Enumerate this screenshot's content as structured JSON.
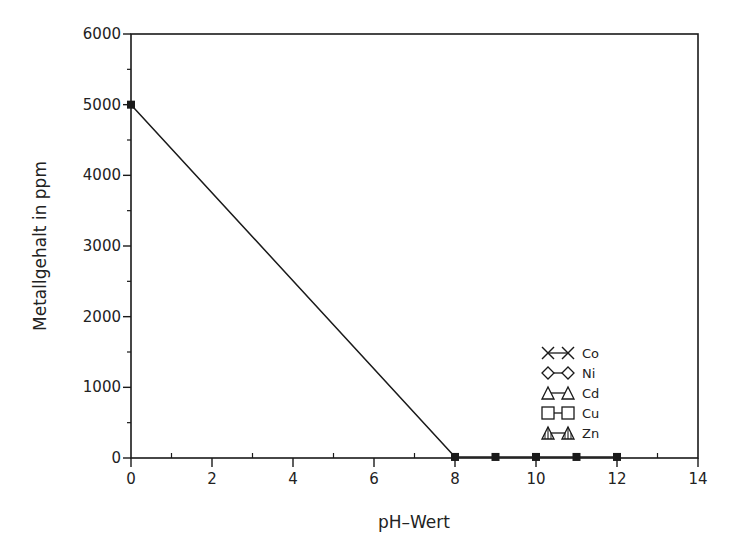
{
  "chart_data": {
    "type": "line",
    "title": "",
    "xlabel": "pH–Wert",
    "ylabel": "Metallgehalt in ppm",
    "xlim": [
      0,
      14
    ],
    "ylim": [
      0,
      6000
    ],
    "x_ticks": [
      0,
      2,
      4,
      6,
      8,
      10,
      12,
      14
    ],
    "x_tick_labels": [
      "0",
      "2",
      "4",
      "6",
      "8",
      "10",
      "12",
      "14"
    ],
    "x_minor_ticks": [
      1,
      3,
      5,
      7,
      9,
      11,
      13
    ],
    "y_ticks": [
      0,
      1000,
      2000,
      3000,
      4000,
      5000,
      6000
    ],
    "y_tick_labels": [
      "0",
      "1000",
      "2000",
      "3000",
      "4000",
      "5000",
      "6000"
    ],
    "y_minor_ticks": [
      500,
      1500,
      2500,
      3500,
      4500,
      5500
    ],
    "grid": false,
    "legend_position": "lower right, inside plot",
    "series": [
      {
        "name": "Co",
        "marker": "x",
        "x": [
          0,
          8,
          9,
          10,
          11,
          12
        ],
        "y": [
          5000,
          15,
          15,
          15,
          15,
          15
        ]
      },
      {
        "name": "Ni",
        "marker": "diamond",
        "x": [
          0,
          8,
          9,
          10,
          11,
          12
        ],
        "y": [
          5000,
          15,
          15,
          15,
          15,
          15
        ]
      },
      {
        "name": "Cd",
        "marker": "triangle-open",
        "x": [
          0,
          8,
          9,
          10,
          11,
          12
        ],
        "y": [
          5000,
          15,
          15,
          15,
          15,
          15
        ]
      },
      {
        "name": "Cu",
        "marker": "square-open",
        "x": [
          0,
          8,
          9,
          10,
          11,
          12
        ],
        "y": [
          5000,
          15,
          15,
          15,
          15,
          15
        ]
      },
      {
        "name": "Zn",
        "marker": "triangle-hatched",
        "x": [
          0,
          8,
          9,
          10,
          11,
          12
        ],
        "y": [
          5000,
          15,
          15,
          15,
          15,
          15
        ]
      }
    ],
    "observed_points": {
      "x": [
        0,
        8,
        9,
        10,
        11,
        12
      ],
      "y": [
        5000,
        15,
        15,
        15,
        15,
        15
      ],
      "note_marker": "filled square (overlapping series)"
    }
  },
  "legend": {
    "items": [
      {
        "label": "Co",
        "marker": "x"
      },
      {
        "label": "Ni",
        "marker": "diamond"
      },
      {
        "label": "Cd",
        "marker": "triangle-open"
      },
      {
        "label": "Cu",
        "marker": "square-open"
      },
      {
        "label": "Zn",
        "marker": "triangle-hatched"
      }
    ]
  },
  "colors": {
    "ink": "#1a1a1a",
    "background": "#ffffff"
  }
}
